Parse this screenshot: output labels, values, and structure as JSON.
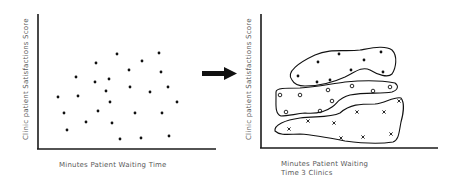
{
  "colors": {
    "axis": "#1a1a1a",
    "point": "#111111",
    "text": "#5a5a5a",
    "background": "#ffffff"
  },
  "left_panel": {
    "ylabel": "Clinic patient Satisfactions Score",
    "xlabel": "Minutes Patient Waiting Time",
    "points": [
      [
        117,
        54
      ],
      [
        159,
        53
      ],
      [
        96,
        63
      ],
      [
        142,
        61
      ],
      [
        129,
        70
      ],
      [
        161,
        72
      ],
      [
        76,
        77
      ],
      [
        95,
        82
      ],
      [
        109,
        79
      ],
      [
        106,
        91
      ],
      [
        130,
        87
      ],
      [
        150,
        92
      ],
      [
        168,
        87
      ],
      [
        58,
        97
      ],
      [
        78,
        96
      ],
      [
        110,
        102
      ],
      [
        177,
        102
      ],
      [
        64,
        113
      ],
      [
        98,
        111
      ],
      [
        135,
        113
      ],
      [
        162,
        113
      ],
      [
        86,
        122
      ],
      [
        112,
        123
      ],
      [
        67,
        130
      ],
      [
        120,
        139
      ],
      [
        141,
        138
      ],
      [
        169,
        136
      ]
    ]
  },
  "arrow": {
    "direction": "right"
  },
  "right_panel": {
    "ylabel": "Clinic patient Satisfactions Score",
    "xlabel_line1": "Minutes Patient Waiting",
    "xlabel_line2": "Time 3 Clinics",
    "clusters": [
      {
        "name": "clinic-1",
        "marker": "dot",
        "points": [
          [
            339,
            54
          ],
          [
            381,
            52
          ],
          [
            318,
            62
          ],
          [
            364,
            60
          ],
          [
            351,
            70
          ],
          [
            383,
            72
          ],
          [
            298,
            76
          ],
          [
            317,
            82
          ],
          [
            330,
            80
          ]
        ]
      },
      {
        "name": "clinic-2",
        "marker": "circle",
        "points": [
          [
            280,
            95
          ],
          [
            300,
            95
          ],
          [
            328,
            90
          ],
          [
            352,
            86
          ],
          [
            373,
            91
          ],
          [
            390,
            87
          ],
          [
            332,
            101
          ],
          [
            286,
            112
          ],
          [
            320,
            111
          ]
        ]
      },
      {
        "name": "clinic-3",
        "marker": "cross",
        "points": [
          [
            357,
            112
          ],
          [
            384,
            112
          ],
          [
            308,
            121
          ],
          [
            334,
            123
          ],
          [
            289,
            129
          ],
          [
            341,
            138
          ],
          [
            363,
            137
          ],
          [
            391,
            134
          ],
          [
            399,
            101
          ]
        ]
      }
    ]
  }
}
